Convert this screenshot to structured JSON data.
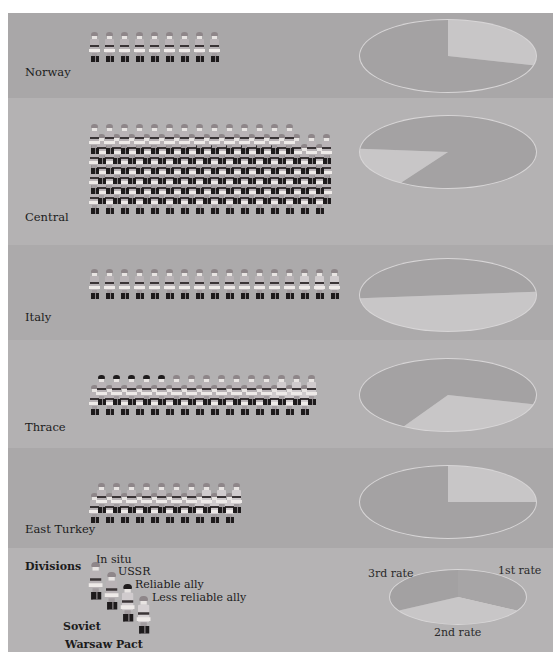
{
  "colors": {
    "band_norway": "#a9a7a8",
    "band_central": "#b4b2b3",
    "band_italy": "#acaaab",
    "band_thrace": "#b3b1b2",
    "band_east_turkey": "#aaa8a9",
    "band_legend": "#b5b3b4",
    "pie_dark": "#a4a2a3",
    "pie_light": "#c8c6c7",
    "pie_mid": "#b8b6b7",
    "pie_rim": "#d8d6d7",
    "helmet_soviet": "#8e8689",
    "helmet_ally": "#1f1c1d"
  },
  "regions": [
    {
      "name": "Norway",
      "soldiers": 9,
      "rows": 1
    },
    {
      "name": "Central",
      "soldiers": 110,
      "rows": 7
    },
    {
      "name": "Italy",
      "soldiers": 17,
      "rows": 1
    },
    {
      "name": "Thrace",
      "soldiers": 30,
      "rows": 2
    },
    {
      "name": "East Turkey",
      "soldiers": 20,
      "rows": 2
    }
  ],
  "legend": {
    "title": "Divisions",
    "items": [
      "In situ",
      "USSR",
      "Reliable ally",
      "Less reliable ally"
    ],
    "groups": [
      "Soviet",
      "Warsaw Pact"
    ],
    "pie_labels": {
      "first": "1st rate",
      "second": "2nd rate",
      "third": "3rd rate"
    }
  },
  "chart_data": {
    "type": "pie",
    "legend": [
      "1st rate",
      "2nd rate",
      "3rd rate"
    ],
    "categories": [
      "Norway",
      "Central",
      "Italy",
      "Thrace",
      "East Turkey"
    ],
    "series": [
      {
        "name": "Norway",
        "slices": [
          {
            "label": "light",
            "start_deg": 0,
            "end_deg": 105
          },
          {
            "label": "dark",
            "start_deg": 105,
            "end_deg": 360
          }
        ],
        "light_share": 0.29
      },
      {
        "name": "Central",
        "slices": [
          {
            "label": "light",
            "start_deg": 212,
            "end_deg": 275
          },
          {
            "label": "dark",
            "start_deg": 275,
            "end_deg": 572
          }
        ],
        "light_share": 0.18
      },
      {
        "name": "Italy",
        "slices": [
          {
            "label": "light",
            "start_deg": 85,
            "end_deg": 265
          },
          {
            "label": "dark",
            "start_deg": 265,
            "end_deg": 445
          }
        ],
        "light_share": 0.5
      },
      {
        "name": "Thrace",
        "slices": [
          {
            "label": "light",
            "start_deg": 105,
            "end_deg": 210
          },
          {
            "label": "dark",
            "start_deg": 210,
            "end_deg": 465
          }
        ],
        "light_share": 0.29
      },
      {
        "name": "East Turkey",
        "slices": [
          {
            "label": "light",
            "start_deg": 0,
            "end_deg": 90
          },
          {
            "label": "dark",
            "start_deg": 90,
            "end_deg": 360
          }
        ],
        "light_share": 0.25
      }
    ],
    "legend_pie": {
      "slices": [
        {
          "label": "1st rate",
          "start_deg": 0,
          "end_deg": 120
        },
        {
          "label": "2nd rate",
          "start_deg": 120,
          "end_deg": 240
        },
        {
          "label": "3rd rate",
          "start_deg": 240,
          "end_deg": 360
        }
      ]
    }
  }
}
